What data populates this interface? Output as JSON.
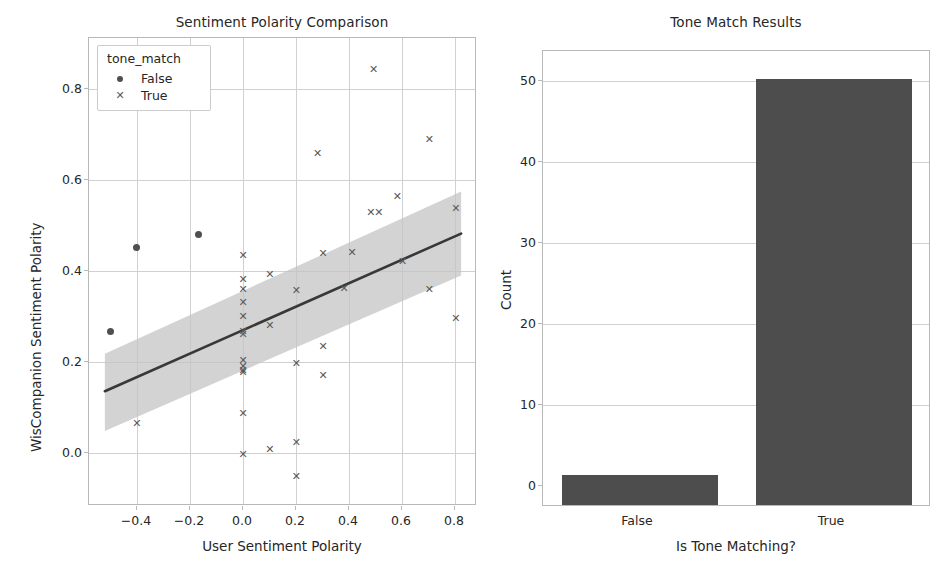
{
  "figure": {
    "width": 952,
    "height": 577,
    "background": "#ffffff",
    "marker_color": "#5a5a5a",
    "line_color": "#383838",
    "band_color": "#c4c4c4",
    "bar_color": "#4d4d4d",
    "grid_color": "#d0d0d0",
    "frame_color": "#b8b8b8"
  },
  "chart_data": [
    {
      "type": "scatter",
      "title": "Sentiment Polarity Comparison",
      "xlabel": "User Sentiment Polarity",
      "ylabel": "WisCompanion Sentiment Polarity",
      "xlim": [
        -0.58,
        0.88
      ],
      "ylim": [
        -0.13,
        0.93
      ],
      "xticks": [
        -0.4,
        -0.2,
        0.0,
        0.2,
        0.4,
        0.6,
        0.8
      ],
      "xtick_labels": [
        "−0.4",
        "−0.2",
        "0.0",
        "0.2",
        "0.4",
        "0.6",
        "0.8"
      ],
      "yticks": [
        0.0,
        0.2,
        0.4,
        0.6,
        0.8
      ],
      "ytick_labels": [
        "0.0",
        "0.2",
        "0.4",
        "0.6",
        "0.8"
      ],
      "grid": true,
      "legend": {
        "title": "tone_match",
        "position": "upper left",
        "entries": [
          {
            "label": "False",
            "marker": "circle"
          },
          {
            "label": "True",
            "marker": "x"
          }
        ]
      },
      "series": [
        {
          "name": "False",
          "marker": "circle",
          "points": [
            {
              "x": -0.5,
              "y": 0.265
            },
            {
              "x": -0.4,
              "y": 0.455
            },
            {
              "x": -0.17,
              "y": 0.485
            }
          ]
        },
        {
          "name": "True",
          "marker": "x",
          "points": [
            {
              "x": -0.4,
              "y": 0.058
            },
            {
              "x": 0.0,
              "y": 0.437
            },
            {
              "x": 0.0,
              "y": 0.382
            },
            {
              "x": 0.0,
              "y": 0.36
            },
            {
              "x": 0.0,
              "y": 0.33
            },
            {
              "x": 0.0,
              "y": 0.3
            },
            {
              "x": 0.0,
              "y": 0.265
            },
            {
              "x": 0.0,
              "y": 0.258
            },
            {
              "x": 0.0,
              "y": 0.2
            },
            {
              "x": 0.0,
              "y": 0.185
            },
            {
              "x": 0.0,
              "y": 0.178
            },
            {
              "x": 0.0,
              "y": 0.172
            },
            {
              "x": 0.0,
              "y": 0.08
            },
            {
              "x": 0.0,
              "y": -0.013
            },
            {
              "x": 0.1,
              "y": 0.395
            },
            {
              "x": 0.1,
              "y": 0.278
            },
            {
              "x": 0.1,
              "y": -0.002
            },
            {
              "x": 0.2,
              "y": 0.358
            },
            {
              "x": 0.2,
              "y": 0.192
            },
            {
              "x": 0.2,
              "y": 0.013
            },
            {
              "x": 0.2,
              "y": -0.063
            },
            {
              "x": 0.28,
              "y": 0.668
            },
            {
              "x": 0.3,
              "y": 0.442
            },
            {
              "x": 0.3,
              "y": 0.232
            },
            {
              "x": 0.3,
              "y": 0.165
            },
            {
              "x": 0.38,
              "y": 0.362
            },
            {
              "x": 0.41,
              "y": 0.445
            },
            {
              "x": 0.49,
              "y": 0.858
            },
            {
              "x": 0.48,
              "y": 0.535
            },
            {
              "x": 0.51,
              "y": 0.535
            },
            {
              "x": 0.58,
              "y": 0.572
            },
            {
              "x": 0.6,
              "y": 0.423
            },
            {
              "x": 0.7,
              "y": 0.7
            },
            {
              "x": 0.7,
              "y": 0.36
            },
            {
              "x": 0.8,
              "y": 0.545
            },
            {
              "x": 0.8,
              "y": 0.295
            }
          ]
        }
      ],
      "regression": {
        "x_start": -0.52,
        "y_start": 0.13,
        "x_end": 0.82,
        "y_end": 0.487,
        "band_upper_start": 0.215,
        "band_lower_start": 0.04,
        "band_upper_end": 0.582,
        "band_lower_end": 0.392
      }
    },
    {
      "type": "bar",
      "title": "Tone Match Results",
      "xlabel": "Is Tone Matching?",
      "ylabel": "Count",
      "categories": [
        "False",
        "True"
      ],
      "values": [
        4,
        53
      ],
      "yticks": [
        0,
        10,
        20,
        30,
        40,
        50
      ],
      "ytick_labels": [
        "0",
        "10",
        "20",
        "30",
        "40",
        "50"
      ],
      "ylim": [
        0,
        56.5
      ],
      "grid": true
    }
  ]
}
